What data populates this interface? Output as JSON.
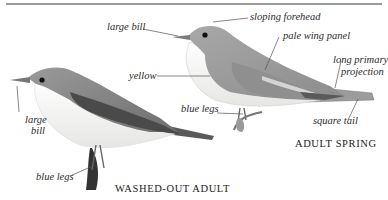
{
  "figure": {
    "adult_spring": {
      "caption": "ADULT SPRING",
      "labels": {
        "sloping_forehead": "sloping forehead",
        "large_bill": "large bill",
        "pale_wing_panel": "pale wing panel",
        "long_primary_projection_1": "long primary",
        "long_primary_projection_2": "projection",
        "yellow": "yellow",
        "blue_legs": "blue legs",
        "square_tail": "square tail"
      }
    },
    "washed_out_adult": {
      "caption": "WASHED-OUT ADULT",
      "labels": {
        "large_bill_1": "large",
        "large_bill_2": "bill",
        "blue_legs": "blue legs"
      }
    }
  },
  "colors": {
    "rule": "#9a9a9a",
    "leader_line": "#555555",
    "bird_back": "#8a8a8a",
    "bird_wing_dark": "#4a4a4a",
    "bird_belly": "#f4f4f2"
  }
}
